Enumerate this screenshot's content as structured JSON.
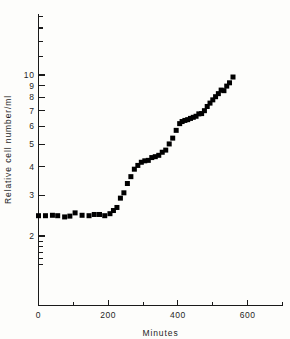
{
  "figure": {
    "background": "#fdfdfb",
    "ink": "#1a1a1a",
    "marker_color": "#000000"
  },
  "axis_labels": {
    "x_title": "Minutes",
    "y_title": "Relative cell number/ml"
  },
  "chart_data": {
    "type": "scatter",
    "title": "",
    "subtitle": "",
    "xlabel": "Minutes",
    "ylabel": "Relative cell number/ml",
    "xscale": "linear",
    "yscale": "log",
    "xlim": [
      0,
      700
    ],
    "ylim": [
      1.45,
      20
    ],
    "grid": false,
    "legend": null,
    "legend_position": "none",
    "xticks": [
      0,
      100,
      200,
      300,
      400,
      500,
      600,
      700
    ],
    "xticklabels": [
      "0",
      "",
      "200",
      "",
      "400",
      "",
      "600",
      ""
    ],
    "yticks": [
      2,
      3,
      4,
      5,
      6,
      7,
      8,
      9,
      10,
      20
    ],
    "yticklabels": [
      "2",
      "3",
      "4",
      "5",
      "6",
      "7",
      "8",
      "9",
      "10",
      "20"
    ],
    "marker": "square",
    "marker_size": 5,
    "series": [
      {
        "name": "Relative cell number/ml",
        "x": [
          0,
          20,
          40,
          55,
          75,
          90,
          105,
          125,
          145,
          160,
          175,
          190,
          205,
          215,
          225,
          235,
          245,
          255,
          265,
          275,
          285,
          295,
          305,
          315,
          325,
          335,
          345,
          355,
          365,
          375,
          385,
          395,
          405,
          412,
          420,
          428,
          436,
          444,
          452,
          460,
          468,
          476,
          484,
          492,
          500,
          508,
          516,
          524,
          532,
          540,
          548,
          558
        ],
        "y": [
          2.45,
          2.45,
          2.46,
          2.45,
          2.42,
          2.44,
          2.52,
          2.46,
          2.45,
          2.48,
          2.48,
          2.45,
          2.5,
          2.58,
          2.66,
          2.92,
          3.08,
          3.38,
          3.62,
          3.9,
          4.05,
          4.18,
          4.24,
          4.26,
          4.38,
          4.42,
          4.48,
          4.62,
          4.72,
          5.02,
          5.32,
          5.75,
          6.15,
          6.28,
          6.35,
          6.4,
          6.48,
          6.55,
          6.62,
          6.78,
          6.8,
          7.0,
          7.3,
          7.55,
          7.8,
          8.05,
          8.3,
          8.6,
          8.55,
          8.95,
          9.25,
          9.8
        ]
      }
    ]
  }
}
